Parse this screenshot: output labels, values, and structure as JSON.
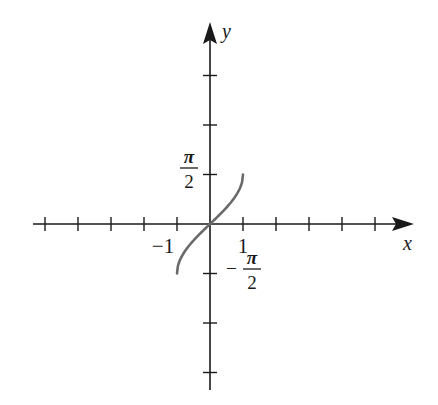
{
  "chart_data": {
    "type": "line",
    "title": "",
    "xlabel": "x",
    "ylabel": "y",
    "function": "y = arcsin(x)",
    "xlim": [
      -5.4,
      6.2
    ],
    "ylim": [
      -3.4,
      4.9
    ],
    "grid": false,
    "legend": null,
    "x_tick_labels": [
      {
        "value": -1,
        "label": "−1"
      },
      {
        "value": 1,
        "label": "1"
      }
    ],
    "y_tick_labels": [
      {
        "value": 1.5708,
        "label_num": "π",
        "label_den": "2",
        "sign": ""
      },
      {
        "value": -1.5708,
        "label_num": "π",
        "label_den": "2",
        "sign": "−"
      }
    ],
    "x_ticks": [
      -5,
      -4,
      -3,
      -2,
      -1,
      1,
      2,
      3,
      4,
      5
    ],
    "y_ticks_in_half_pi": [
      -3,
      -2,
      -1,
      1,
      2,
      3
    ],
    "series": [
      {
        "name": "arcsin(x)",
        "color": "#6a6a6a",
        "x": [
          -1,
          -0.9,
          -0.75,
          -0.5,
          -0.25,
          0,
          0.25,
          0.5,
          0.75,
          0.9,
          1
        ],
        "y": [
          -1.5708,
          -1.1198,
          -0.8481,
          -0.5236,
          -0.2527,
          0,
          0.2527,
          0.5236,
          0.8481,
          1.1198,
          1.5708
        ]
      }
    ]
  },
  "labels": {
    "x_axis": "x",
    "y_axis": "y",
    "neg_one": "−1",
    "one": "1",
    "pi": "π",
    "two": "2",
    "minus": "−"
  },
  "colors": {
    "axis": "#1a1a1a",
    "curve": "#6a6a6a",
    "background": "#ffffff"
  }
}
